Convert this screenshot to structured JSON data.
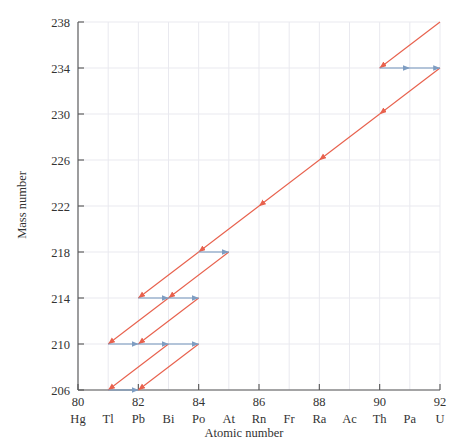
{
  "chart_data": {
    "type": "scatter",
    "title": "",
    "xlabel": "Atomic number",
    "ylabel": "Mass number",
    "xlim": [
      80,
      92
    ],
    "ylim": [
      206,
      238
    ],
    "grid": true,
    "legend": null,
    "x_ticks": [
      80,
      82,
      84,
      86,
      88,
      90,
      92
    ],
    "x_tick_labels": [
      "80",
      "82",
      "84",
      "86",
      "88",
      "90",
      "92"
    ],
    "y_ticks": [
      206,
      210,
      214,
      218,
      222,
      226,
      230,
      234,
      238
    ],
    "y_tick_labels": [
      "206",
      "210",
      "214",
      "218",
      "222",
      "226",
      "230",
      "234",
      "238"
    ],
    "element_symbols": [
      {
        "z": 80,
        "symbol": "Hg"
      },
      {
        "z": 81,
        "symbol": "Tl"
      },
      {
        "z": 82,
        "symbol": "Pb"
      },
      {
        "z": 83,
        "symbol": "Bi"
      },
      {
        "z": 84,
        "symbol": "Po"
      },
      {
        "z": 85,
        "symbol": "At"
      },
      {
        "z": 86,
        "symbol": "Rn"
      },
      {
        "z": 87,
        "symbol": "Fr"
      },
      {
        "z": 88,
        "symbol": "Ra"
      },
      {
        "z": 89,
        "symbol": "Ac"
      },
      {
        "z": 90,
        "symbol": "Th"
      },
      {
        "z": 91,
        "symbol": "Pa"
      },
      {
        "z": 92,
        "symbol": "U"
      }
    ],
    "colors": {
      "alpha": "#e8614d",
      "beta": "#7e9dc2",
      "grid": "#e9e9ef",
      "axis": "#555555",
      "text": "#333333"
    },
    "alpha_decays": [
      {
        "from": [
          92,
          238
        ],
        "to": [
          90,
          234
        ]
      },
      {
        "from": [
          92,
          234
        ],
        "to": [
          90,
          230
        ]
      },
      {
        "from": [
          90,
          230
        ],
        "to": [
          88,
          226
        ]
      },
      {
        "from": [
          88,
          226
        ],
        "to": [
          86,
          222
        ]
      },
      {
        "from": [
          86,
          222
        ],
        "to": [
          84,
          218
        ]
      },
      {
        "from": [
          84,
          218
        ],
        "to": [
          82,
          214
        ]
      },
      {
        "from": [
          85,
          218
        ],
        "to": [
          83,
          214
        ]
      },
      {
        "from": [
          84,
          214
        ],
        "to": [
          82,
          210
        ]
      },
      {
        "from": [
          83,
          214
        ],
        "to": [
          81,
          210
        ]
      },
      {
        "from": [
          84,
          210
        ],
        "to": [
          82,
          206
        ]
      },
      {
        "from": [
          83,
          210
        ],
        "to": [
          81,
          206
        ]
      }
    ],
    "beta_decays": [
      {
        "from": [
          90,
          234
        ],
        "to": [
          91,
          234
        ]
      },
      {
        "from": [
          91,
          234
        ],
        "to": [
          92,
          234
        ]
      },
      {
        "from": [
          84,
          218
        ],
        "to": [
          85,
          218
        ]
      },
      {
        "from": [
          82,
          214
        ],
        "to": [
          83,
          214
        ]
      },
      {
        "from": [
          83,
          214
        ],
        "to": [
          84,
          214
        ]
      },
      {
        "from": [
          81,
          210
        ],
        "to": [
          82,
          210
        ]
      },
      {
        "from": [
          82,
          210
        ],
        "to": [
          83,
          210
        ]
      },
      {
        "from": [
          83,
          210
        ],
        "to": [
          84,
          210
        ]
      },
      {
        "from": [
          81,
          206
        ],
        "to": [
          82,
          206
        ]
      }
    ],
    "nuclides": [
      {
        "z": 92,
        "a": 238,
        "label": "U-238"
      },
      {
        "z": 90,
        "a": 234,
        "label": "Th-234"
      },
      {
        "z": 91,
        "a": 234,
        "label": "Pa-234"
      },
      {
        "z": 92,
        "a": 234,
        "label": "U-234"
      },
      {
        "z": 90,
        "a": 230,
        "label": "Th-230"
      },
      {
        "z": 88,
        "a": 226,
        "label": "Ra-226"
      },
      {
        "z": 86,
        "a": 222,
        "label": "Rn-222"
      },
      {
        "z": 84,
        "a": 218,
        "label": "Po-218"
      },
      {
        "z": 85,
        "a": 218,
        "label": "At-218"
      },
      {
        "z": 82,
        "a": 214,
        "label": "Pb-214"
      },
      {
        "z": 83,
        "a": 214,
        "label": "Bi-214"
      },
      {
        "z": 84,
        "a": 214,
        "label": "Po-214"
      },
      {
        "z": 81,
        "a": 210,
        "label": "Tl-210"
      },
      {
        "z": 82,
        "a": 210,
        "label": "Pb-210"
      },
      {
        "z": 83,
        "a": 210,
        "label": "Bi-210"
      },
      {
        "z": 84,
        "a": 210,
        "label": "Po-210"
      },
      {
        "z": 81,
        "a": 206,
        "label": "Tl-206"
      },
      {
        "z": 82,
        "a": 206,
        "label": "Pb-206"
      }
    ]
  }
}
